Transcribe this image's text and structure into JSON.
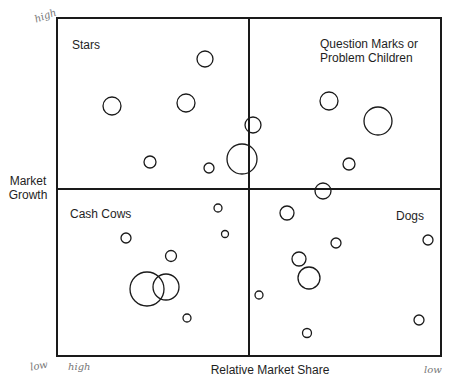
{
  "diagram": {
    "type": "BCG growth-share matrix",
    "frame": {
      "left": 57,
      "top": 18,
      "right": 441,
      "bottom": 356,
      "divider_x": 249,
      "divider_y": 189
    },
    "line_color": "#1a1a1a",
    "quadrants": {
      "top_left": {
        "label": "Stars"
      },
      "top_right": {
        "label_line1": "Question Marks or",
        "label_line2": "Problem Children"
      },
      "bottom_left": {
        "label": "Cash Cows"
      },
      "bottom_right": {
        "label": "Dogs"
      }
    },
    "axes": {
      "y_label_line1": "Market",
      "y_label_line2": "Growth",
      "x_label": "Relative Market Share"
    },
    "handwritten": {
      "top_left": "high",
      "bottom_left_y": "low",
      "bottom_left_x": "high",
      "bottom_right": "low"
    },
    "circles": [
      {
        "quadrant": "stars",
        "cx": 205,
        "cy": 59,
        "r": 8
      },
      {
        "quadrant": "stars",
        "cx": 112,
        "cy": 106,
        "r": 9
      },
      {
        "quadrant": "stars",
        "cx": 186,
        "cy": 103,
        "r": 9
      },
      {
        "quadrant": "stars",
        "cx": 150,
        "cy": 162,
        "r": 6
      },
      {
        "quadrant": "stars",
        "cx": 209,
        "cy": 168,
        "r": 5
      },
      {
        "quadrant": "stars",
        "cx": 242,
        "cy": 159,
        "r": 15
      },
      {
        "quadrant": "question-marks",
        "cx": 253,
        "cy": 125,
        "r": 8
      },
      {
        "quadrant": "question-marks",
        "cx": 329,
        "cy": 101,
        "r": 9
      },
      {
        "quadrant": "question-marks",
        "cx": 378,
        "cy": 121,
        "r": 14
      },
      {
        "quadrant": "question-marks",
        "cx": 349,
        "cy": 164,
        "r": 6
      },
      {
        "quadrant": "question-marks",
        "cx": 323,
        "cy": 191,
        "r": 8
      },
      {
        "quadrant": "cash-cows",
        "cx": 218,
        "cy": 208,
        "r": 4
      },
      {
        "quadrant": "cash-cows",
        "cx": 225,
        "cy": 234,
        "r": 3.5
      },
      {
        "quadrant": "cash-cows",
        "cx": 126,
        "cy": 238,
        "r": 5
      },
      {
        "quadrant": "cash-cows",
        "cx": 171,
        "cy": 256,
        "r": 5.5
      },
      {
        "quadrant": "cash-cows",
        "cx": 147,
        "cy": 289,
        "r": 17
      },
      {
        "quadrant": "cash-cows",
        "cx": 166,
        "cy": 287,
        "r": 13
      },
      {
        "quadrant": "cash-cows",
        "cx": 187,
        "cy": 318,
        "r": 4
      },
      {
        "quadrant": "dogs",
        "cx": 287,
        "cy": 213,
        "r": 7
      },
      {
        "quadrant": "dogs",
        "cx": 336,
        "cy": 243,
        "r": 5
      },
      {
        "quadrant": "dogs",
        "cx": 428,
        "cy": 240,
        "r": 5
      },
      {
        "quadrant": "dogs",
        "cx": 299,
        "cy": 259,
        "r": 7
      },
      {
        "quadrant": "dogs",
        "cx": 309,
        "cy": 278,
        "r": 11
      },
      {
        "quadrant": "dogs",
        "cx": 259,
        "cy": 295,
        "r": 4
      },
      {
        "quadrant": "dogs",
        "cx": 419,
        "cy": 320,
        "r": 5
      },
      {
        "quadrant": "dogs",
        "cx": 307,
        "cy": 333,
        "r": 4.5
      }
    ]
  }
}
